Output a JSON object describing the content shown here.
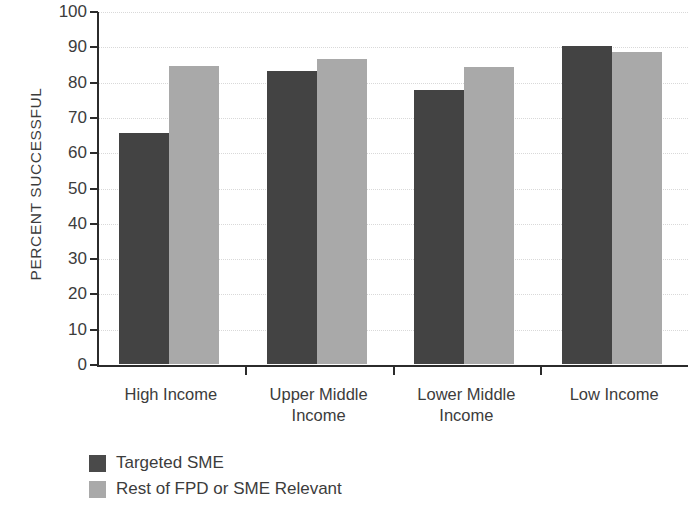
{
  "chart_data": {
    "type": "bar",
    "title": "",
    "xlabel": "",
    "ylabel": "PERCENT SUCCESSFUL",
    "ylim": [
      0,
      100
    ],
    "yticks": [
      0,
      10,
      20,
      30,
      40,
      50,
      60,
      70,
      80,
      90,
      100
    ],
    "ytick_labels": [
      "0",
      "10",
      "20",
      "30",
      "40",
      "50",
      "60",
      "70",
      "80",
      "90",
      "100"
    ],
    "grid": true,
    "grid_axis": "y",
    "legend_position": "bottom-left",
    "categories": [
      "High Income",
      "Upper Middle Income",
      "Lower Middle Income",
      "Low Income"
    ],
    "category_lines": [
      [
        "High Income"
      ],
      [
        "Upper Middle",
        "Income"
      ],
      [
        "Lower Middle",
        "Income"
      ],
      [
        "Low Income"
      ]
    ],
    "series": [
      {
        "name": "Targeted SME",
        "color": "#434343",
        "values": [
          65.5,
          83.0,
          77.5,
          90.0
        ]
      },
      {
        "name": "Rest of FPD or SME Relevant",
        "color": "#a9a9a9",
        "values": [
          84.5,
          86.3,
          84.0,
          88.3
        ]
      }
    ]
  },
  "legend": {
    "items": [
      {
        "label": "Targeted SME",
        "color": "#434343"
      },
      {
        "label": "Rest of FPD or SME Relevant",
        "color": "#a9a9a9"
      }
    ]
  }
}
